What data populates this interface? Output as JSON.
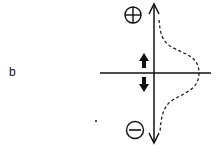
{
  "figure": {
    "panel_label": "b",
    "top_symbol": "plus",
    "bottom_symbol": "minus",
    "colors": {
      "stroke": "#111111",
      "background": "#ffffff"
    },
    "elements": {
      "vertical_axis": "double-headed arrow",
      "horizontal_axis": "line",
      "bold_arrows": [
        "up",
        "down"
      ],
      "dashed_curve": "bell-shaped distribution"
    }
  }
}
